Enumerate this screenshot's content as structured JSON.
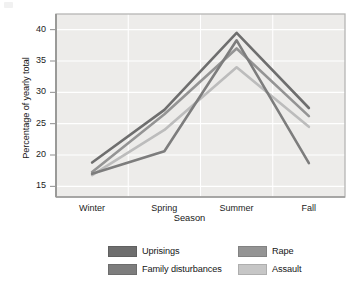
{
  "chart_data": {
    "type": "line",
    "title": "",
    "xlabel": "Season",
    "ylabel": "Percentage of yearly total",
    "categories": [
      "Winter",
      "Spring",
      "Summer",
      "Fall"
    ],
    "yticks": [
      15,
      20,
      25,
      30,
      35,
      40
    ],
    "ylim": [
      13.3,
      42.5
    ],
    "grid": true,
    "legend_position": "bottom",
    "series": [
      {
        "name": "Uprisings",
        "color": "#6e6e6e",
        "values": [
          18.8,
          27.2,
          39.5,
          27.5
        ]
      },
      {
        "name": "Family disturbances",
        "color": "#7d7d7d",
        "values": [
          17.0,
          20.6,
          38.3,
          18.7
        ]
      },
      {
        "name": "Rape",
        "color": "#949494",
        "values": [
          17.3,
          26.5,
          37.0,
          26.2
        ]
      },
      {
        "name": "Assault",
        "color": "#bcbcbc",
        "values": [
          16.8,
          24.0,
          34.0,
          24.5
        ]
      }
    ]
  },
  "axes": {
    "y_title": "Percentage of yearly total",
    "x_title": "Season",
    "y_tick_labels": [
      "40",
      "35",
      "30",
      "25",
      "20",
      "15"
    ],
    "x_tick_labels": [
      "Winter",
      "Spring",
      "Summer",
      "Fall"
    ]
  },
  "legend": {
    "entries": [
      {
        "label": "Uprisings",
        "color": "#6e6e6e"
      },
      {
        "label": "Rape",
        "color": "#949494"
      },
      {
        "label": "Family disturbances",
        "color": "#7d7d7d"
      },
      {
        "label": "Assault",
        "color": "#c6c6c6"
      }
    ]
  },
  "style": {
    "plot_background": "#edecea",
    "gridline_color": "#ffffff",
    "plot_border_color": "#b6b6b4",
    "page_background": "#ffffff"
  }
}
